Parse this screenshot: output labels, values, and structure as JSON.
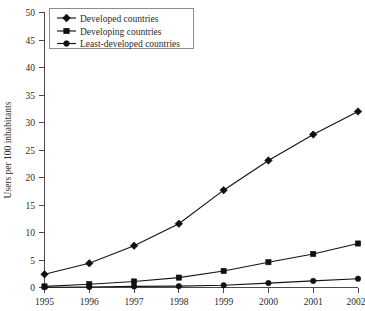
{
  "chart_data": {
    "type": "line",
    "title": "",
    "xlabel": "",
    "ylabel": "Users per 100 inhabitants",
    "categories": [
      "1995",
      "1996",
      "1997",
      "1998",
      "1999",
      "2000",
      "2001",
      "2002"
    ],
    "x": [
      1995,
      1996,
      1997,
      1998,
      1999,
      2000,
      2001,
      2002
    ],
    "ylim": [
      0,
      50
    ],
    "yticks": [
      0,
      5,
      10,
      15,
      20,
      25,
      30,
      35,
      40,
      45,
      50
    ],
    "ytick_labels": [
      "0",
      "5",
      "10",
      "15",
      "20",
      "25",
      "30",
      "35",
      "40",
      "45",
      "50"
    ],
    "grid": false,
    "legend_position": "top-left",
    "series": [
      {
        "name": "Developed countries",
        "marker": "diamond",
        "color": "#101010",
        "values": [
          2.4,
          4.4,
          7.6,
          11.6,
          17.7,
          23.1,
          27.8,
          32.0
        ]
      },
      {
        "name": "Developing countries",
        "marker": "square",
        "color": "#101010",
        "values": [
          0.2,
          0.6,
          1.1,
          1.8,
          3.0,
          4.6,
          6.1,
          8.0
        ]
      },
      {
        "name": "Least-developed countries",
        "marker": "circle",
        "color": "#101010",
        "values": [
          0.05,
          0.1,
          0.2,
          0.25,
          0.4,
          0.8,
          1.2,
          1.6
        ]
      }
    ]
  },
  "axes": {
    "y_title": "Users per 100 inhabitants",
    "y_tick_0": "0",
    "y_tick_1": "5",
    "y_tick_2": "10",
    "y_tick_3": "15",
    "y_tick_4": "20",
    "y_tick_5": "25",
    "y_tick_6": "30",
    "y_tick_7": "35",
    "y_tick_8": "40",
    "y_tick_9": "45",
    "y_tick_10": "50",
    "x_tick_0": "1995",
    "x_tick_1": "1996",
    "x_tick_2": "1997",
    "x_tick_3": "1998",
    "x_tick_4": "1999",
    "x_tick_5": "2000",
    "x_tick_6": "2001",
    "x_tick_7": "2002"
  },
  "legend": {
    "item_0": "Developed countries",
    "item_1": "Developing countries",
    "item_2": "Least-developed countries"
  },
  "colors": {
    "line": "#101010",
    "axis": "#4a4a4a",
    "legend_border": "#8d8d8d",
    "background": "#ffffff"
  }
}
